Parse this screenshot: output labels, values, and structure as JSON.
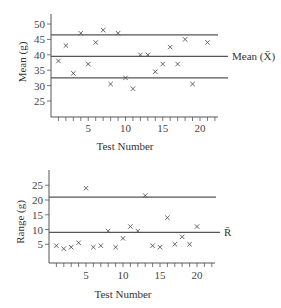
{
  "chart_data": [
    {
      "type": "scatter",
      "title": "",
      "xlabel": "Test Number",
      "ylabel": "Mean (g)",
      "xlim": [
        0,
        22
      ],
      "ylim": [
        20,
        52
      ],
      "x_ticks": [
        5,
        10,
        15,
        20
      ],
      "y_ticks": [
        25,
        30,
        35,
        40,
        45,
        50
      ],
      "grid": false,
      "marker": "x",
      "x": [
        1,
        2,
        3,
        4,
        5,
        6,
        7,
        8,
        9,
        10,
        11,
        12,
        13,
        14,
        15,
        16,
        17,
        18,
        19,
        21
      ],
      "values": [
        38,
        43,
        34,
        47,
        37,
        44,
        48,
        30.5,
        47,
        32.5,
        29,
        40,
        40,
        34.5,
        37,
        42.5,
        37,
        45,
        30.5,
        44
      ],
      "reference_lines": [
        {
          "name": "UCL",
          "value": 46.5,
          "label": ""
        },
        {
          "name": "Center",
          "value": 39.5,
          "label": "Mean (X̄)"
        },
        {
          "name": "LCL",
          "value": 32.5,
          "label": ""
        }
      ]
    },
    {
      "type": "scatter",
      "title": "",
      "xlabel": "Test Number",
      "ylabel": "Range (g)",
      "xlim": [
        0,
        22
      ],
      "ylim": [
        0,
        30
      ],
      "x_ticks": [
        5,
        10,
        15,
        20
      ],
      "y_ticks": [
        5,
        10,
        15,
        20,
        25
      ],
      "grid": false,
      "marker": "x",
      "x": [
        1,
        2,
        3,
        4,
        5,
        6,
        7,
        8,
        9,
        10,
        11,
        12,
        13,
        14,
        15,
        16,
        17,
        18,
        19,
        20
      ],
      "values": [
        4.5,
        3.5,
        4,
        5.5,
        24,
        4,
        4.5,
        9.5,
        4,
        7,
        11,
        9.5,
        21.5,
        4.5,
        4,
        14,
        5,
        7.5,
        5,
        11
      ],
      "reference_lines": [
        {
          "name": "UCL",
          "value": 21,
          "label": ""
        },
        {
          "name": "Center",
          "value": 9,
          "label": "R̄"
        }
      ]
    }
  ],
  "labels": {
    "top_ylabel": "Mean (g)",
    "top_xlabel": "Test Number",
    "top_center_label": "Mean (X̄)",
    "bottom_ylabel": "Range (g)",
    "bottom_xlabel": "Test Number",
    "bottom_center_label": "R̄"
  },
  "colors": {
    "axis": "#555555",
    "line": "#555555",
    "marker": "#555555",
    "text": "#333333"
  }
}
